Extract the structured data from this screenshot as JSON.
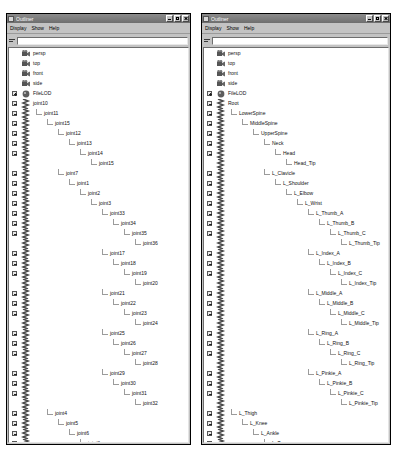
{
  "app": {
    "title": "Outliner",
    "window_icon": "outliner-icon",
    "buttons": {
      "minimize": "_",
      "maximize": "□",
      "close": "×"
    },
    "menu": [
      "Display",
      "Show",
      "Help"
    ],
    "filter": {
      "value": "",
      "placeholder": "",
      "icon": "filter-icon"
    }
  },
  "windows": [
    {
      "id": "left",
      "title": "Outliner",
      "nodes": [
        {
          "label": "persp",
          "depth": 0,
          "icon": "camera-icon",
          "expander": "none"
        },
        {
          "label": "top",
          "depth": 0,
          "icon": "camera-icon",
          "expander": "none"
        },
        {
          "label": "front",
          "depth": 0,
          "icon": "camera-icon",
          "expander": "none"
        },
        {
          "label": "side",
          "depth": 0,
          "icon": "camera-icon",
          "expander": "none"
        },
        {
          "label": "FileLOD",
          "depth": 0,
          "icon": "lod-icon",
          "expander": "plus"
        },
        {
          "label": "joint10",
          "depth": 0,
          "icon": "joint-icon",
          "expander": "minus"
        },
        {
          "label": "joint11",
          "depth": 1,
          "icon": "joint-icon",
          "expander": "minus"
        },
        {
          "label": "joint15",
          "depth": 2,
          "icon": "joint-icon",
          "expander": "minus"
        },
        {
          "label": "joint12",
          "depth": 3,
          "icon": "joint-icon",
          "expander": "minus"
        },
        {
          "label": "joint13",
          "depth": 4,
          "icon": "joint-icon",
          "expander": "minus"
        },
        {
          "label": "joint14",
          "depth": 5,
          "icon": "joint-icon",
          "expander": "minus"
        },
        {
          "label": "joint15",
          "depth": 6,
          "icon": "joint-icon",
          "expander": "none"
        },
        {
          "label": "joint7",
          "depth": 3,
          "icon": "joint-icon",
          "expander": "minus"
        },
        {
          "label": "joint1",
          "depth": 4,
          "icon": "joint-icon",
          "expander": "minus"
        },
        {
          "label": "joint2",
          "depth": 5,
          "icon": "joint-icon",
          "expander": "minus"
        },
        {
          "label": "joint3",
          "depth": 6,
          "icon": "joint-icon",
          "expander": "minus"
        },
        {
          "label": "joint33",
          "depth": 7,
          "icon": "joint-icon",
          "expander": "minus"
        },
        {
          "label": "joint34",
          "depth": 8,
          "icon": "joint-icon",
          "expander": "minus"
        },
        {
          "label": "joint35",
          "depth": 9,
          "icon": "joint-icon",
          "expander": "minus"
        },
        {
          "label": "joint36",
          "depth": 10,
          "icon": "joint-icon",
          "expander": "none"
        },
        {
          "label": "joint17",
          "depth": 7,
          "icon": "joint-icon",
          "expander": "minus"
        },
        {
          "label": "joint18",
          "depth": 8,
          "icon": "joint-icon",
          "expander": "minus"
        },
        {
          "label": "joint19",
          "depth": 9,
          "icon": "joint-icon",
          "expander": "minus"
        },
        {
          "label": "joint20",
          "depth": 10,
          "icon": "joint-icon",
          "expander": "none"
        },
        {
          "label": "joint21",
          "depth": 7,
          "icon": "joint-icon",
          "expander": "minus"
        },
        {
          "label": "joint22",
          "depth": 8,
          "icon": "joint-icon",
          "expander": "minus"
        },
        {
          "label": "joint23",
          "depth": 9,
          "icon": "joint-icon",
          "expander": "minus"
        },
        {
          "label": "joint24",
          "depth": 10,
          "icon": "joint-icon",
          "expander": "none"
        },
        {
          "label": "joint25",
          "depth": 7,
          "icon": "joint-icon",
          "expander": "minus"
        },
        {
          "label": "joint26",
          "depth": 8,
          "icon": "joint-icon",
          "expander": "minus"
        },
        {
          "label": "joint27",
          "depth": 9,
          "icon": "joint-icon",
          "expander": "minus"
        },
        {
          "label": "joint28",
          "depth": 10,
          "icon": "joint-icon",
          "expander": "none"
        },
        {
          "label": "joint29",
          "depth": 7,
          "icon": "joint-icon",
          "expander": "minus"
        },
        {
          "label": "joint30",
          "depth": 8,
          "icon": "joint-icon",
          "expander": "minus"
        },
        {
          "label": "joint31",
          "depth": 9,
          "icon": "joint-icon",
          "expander": "minus"
        },
        {
          "label": "joint32",
          "depth": 10,
          "icon": "joint-icon",
          "expander": "none"
        },
        {
          "label": "joint4",
          "depth": 2,
          "icon": "joint-icon",
          "expander": "minus"
        },
        {
          "label": "joint5",
          "depth": 3,
          "icon": "joint-icon",
          "expander": "minus"
        },
        {
          "label": "joint6",
          "depth": 4,
          "icon": "joint-icon",
          "expander": "minus"
        },
        {
          "label": "joint8",
          "depth": 5,
          "icon": "joint-icon",
          "expander": "minus"
        },
        {
          "label": "joint9",
          "depth": 6,
          "icon": "joint-icon",
          "expander": "none"
        },
        {
          "label": "defaultLightSet",
          "depth": 0,
          "icon": "set-icon",
          "expander": "none"
        },
        {
          "label": "defaultObjectSet",
          "depth": 0,
          "icon": "set-icon",
          "expander": "none"
        }
      ]
    },
    {
      "id": "right",
      "title": "Outliner",
      "nodes": [
        {
          "label": "persp",
          "depth": 0,
          "icon": "camera-icon",
          "expander": "none"
        },
        {
          "label": "top",
          "depth": 0,
          "icon": "camera-icon",
          "expander": "none"
        },
        {
          "label": "front",
          "depth": 0,
          "icon": "camera-icon",
          "expander": "none"
        },
        {
          "label": "side",
          "depth": 0,
          "icon": "camera-icon",
          "expander": "none"
        },
        {
          "label": "FileLOD",
          "depth": 0,
          "icon": "lod-icon",
          "expander": "plus"
        },
        {
          "label": "Root",
          "depth": 0,
          "icon": "joint-icon",
          "expander": "minus"
        },
        {
          "label": "LowerSpine",
          "depth": 1,
          "icon": "joint-icon",
          "expander": "minus"
        },
        {
          "label": "MiddleSpine",
          "depth": 2,
          "icon": "joint-icon",
          "expander": "minus"
        },
        {
          "label": "UpperSpine",
          "depth": 3,
          "icon": "joint-icon",
          "expander": "minus"
        },
        {
          "label": "Neck",
          "depth": 4,
          "icon": "joint-icon",
          "expander": "minus"
        },
        {
          "label": "Head",
          "depth": 5,
          "icon": "joint-icon",
          "expander": "minus"
        },
        {
          "label": "Head_Tip",
          "depth": 6,
          "icon": "joint-icon",
          "expander": "none"
        },
        {
          "label": "L_Clavicle",
          "depth": 4,
          "icon": "joint-icon",
          "expander": "minus"
        },
        {
          "label": "L_Shoulder",
          "depth": 5,
          "icon": "joint-icon",
          "expander": "minus"
        },
        {
          "label": "L_Elbow",
          "depth": 6,
          "icon": "joint-icon",
          "expander": "minus"
        },
        {
          "label": "L_Wrist",
          "depth": 7,
          "icon": "joint-icon",
          "expander": "minus"
        },
        {
          "label": "L_Thumb_A",
          "depth": 8,
          "icon": "joint-icon",
          "expander": "minus"
        },
        {
          "label": "L_Thumb_B",
          "depth": 9,
          "icon": "joint-icon",
          "expander": "minus"
        },
        {
          "label": "L_Thumb_C",
          "depth": 10,
          "icon": "joint-icon",
          "expander": "minus"
        },
        {
          "label": "L_Thumb_Tip",
          "depth": 11,
          "icon": "joint-icon",
          "expander": "none"
        },
        {
          "label": "L_Index_A",
          "depth": 8,
          "icon": "joint-icon",
          "expander": "minus"
        },
        {
          "label": "L_Index_B",
          "depth": 9,
          "icon": "joint-icon",
          "expander": "minus"
        },
        {
          "label": "L_Index_C",
          "depth": 10,
          "icon": "joint-icon",
          "expander": "minus"
        },
        {
          "label": "L_Index_Tip",
          "depth": 11,
          "icon": "joint-icon",
          "expander": "none"
        },
        {
          "label": "L_Middle_A",
          "depth": 8,
          "icon": "joint-icon",
          "expander": "minus"
        },
        {
          "label": "L_Middle_B",
          "depth": 9,
          "icon": "joint-icon",
          "expander": "minus"
        },
        {
          "label": "L_Middle_C",
          "depth": 10,
          "icon": "joint-icon",
          "expander": "minus"
        },
        {
          "label": "L_Middle_Tip",
          "depth": 11,
          "icon": "joint-icon",
          "expander": "none"
        },
        {
          "label": "L_Ring_A",
          "depth": 8,
          "icon": "joint-icon",
          "expander": "minus"
        },
        {
          "label": "L_Ring_B",
          "depth": 9,
          "icon": "joint-icon",
          "expander": "minus"
        },
        {
          "label": "L_Ring_C",
          "depth": 10,
          "icon": "joint-icon",
          "expander": "minus"
        },
        {
          "label": "L_Ring_Tip",
          "depth": 11,
          "icon": "joint-icon",
          "expander": "none"
        },
        {
          "label": "L_Pinkie_A",
          "depth": 8,
          "icon": "joint-icon",
          "expander": "minus"
        },
        {
          "label": "L_Pinkie_B",
          "depth": 9,
          "icon": "joint-icon",
          "expander": "minus"
        },
        {
          "label": "L_Pinkie_C",
          "depth": 10,
          "icon": "joint-icon",
          "expander": "minus"
        },
        {
          "label": "L_Pinkie_Tip",
          "depth": 11,
          "icon": "joint-icon",
          "expander": "none"
        },
        {
          "label": "L_Thigh",
          "depth": 1,
          "icon": "joint-icon",
          "expander": "minus"
        },
        {
          "label": "L_Knee",
          "depth": 2,
          "icon": "joint-icon",
          "expander": "minus"
        },
        {
          "label": "L_Ankle",
          "depth": 3,
          "icon": "joint-icon",
          "expander": "minus"
        },
        {
          "label": "L_Toe",
          "depth": 4,
          "icon": "joint-icon",
          "expander": "minus"
        },
        {
          "label": "L_Toe_Tip",
          "depth": 5,
          "icon": "joint-icon",
          "expander": "none"
        },
        {
          "label": "defaultLightSet",
          "depth": 0,
          "icon": "set-icon",
          "expander": "none"
        },
        {
          "label": "defaultObjectSet",
          "depth": 0,
          "icon": "set-icon",
          "expander": "none"
        }
      ]
    }
  ],
  "colors": {
    "window_bg": "#c3c3c3",
    "pane_bg": "#ffffff",
    "title_bar": "#6e6e6e",
    "text": "#111111",
    "tree_line": "#9b9b9b"
  }
}
